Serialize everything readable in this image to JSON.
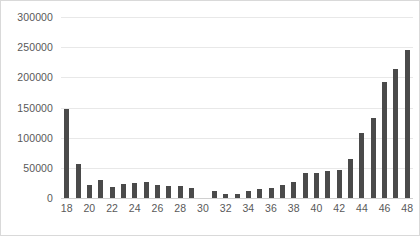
{
  "chart": {
    "background_color": "#ffffff",
    "border_color": "#d9d9d9",
    "bar_color": "#4a4a4a",
    "gridline_color": "#e8e8e8",
    "axis_label_color": "#595959"
  },
  "chart_data": {
    "type": "bar",
    "title": "",
    "subtitle": "",
    "xlabel": "",
    "ylabel": "",
    "grid": true,
    "legend": false,
    "ylim": [
      0,
      300000
    ],
    "ytick_labels": [
      "0",
      "50000",
      "100000",
      "150000",
      "200000",
      "250000",
      "300000"
    ],
    "ytick_values": [
      0,
      50000,
      100000,
      150000,
      200000,
      250000,
      300000
    ],
    "xlim": [
      17.5,
      48.5
    ],
    "xtick_labels": [
      "18",
      "20",
      "22",
      "24",
      "26",
      "28",
      "30",
      "32",
      "34",
      "36",
      "38",
      "40",
      "42",
      "44",
      "46",
      "48"
    ],
    "xtick_values": [
      18,
      20,
      22,
      24,
      26,
      28,
      30,
      32,
      34,
      36,
      38,
      40,
      42,
      44,
      46,
      48
    ],
    "categories": [
      18,
      19,
      20,
      21,
      22,
      23,
      24,
      25,
      26,
      27,
      28,
      29,
      30,
      31,
      32,
      33,
      34,
      35,
      36,
      37,
      38,
      39,
      40,
      41,
      42,
      43,
      44,
      45,
      46,
      47,
      48
    ],
    "values": [
      148000,
      56000,
      21000,
      30000,
      18000,
      23000,
      25000,
      26000,
      22000,
      20000,
      20000,
      16000,
      0,
      12000,
      7000,
      7000,
      12000,
      15000,
      17000,
      22000,
      26000,
      41000,
      41000,
      44000,
      47000,
      64000,
      108000,
      132000,
      193000,
      214000,
      246000
    ]
  }
}
